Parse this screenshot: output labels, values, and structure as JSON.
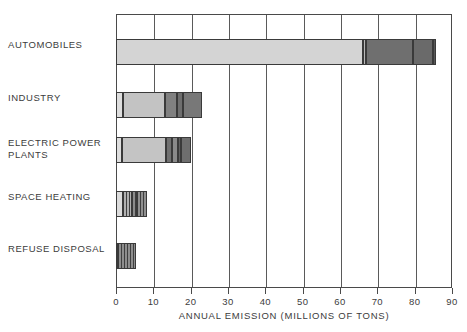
{
  "chart_data": {
    "type": "bar",
    "orientation": "horizontal",
    "stacked": true,
    "title": "",
    "xlabel": "ANNUAL EMISSION (MILLIONS OF TONS)",
    "ylabel": "",
    "xlim": [
      0,
      90
    ],
    "xticks": [
      0,
      10,
      20,
      30,
      40,
      50,
      60,
      70,
      80,
      90
    ],
    "xtick_labels": [
      "0",
      "10",
      "20",
      "30",
      "40",
      "50",
      "60",
      "70",
      "80",
      "90"
    ],
    "grid": "vertical",
    "legend": "none",
    "categories": [
      "AUTOMOBILES",
      "INDUSTRY",
      "ELECTRIC POWER\nPLANTS",
      "SPACE HEATING",
      "REFUSE DISPOSAL"
    ],
    "totals": [
      85.5,
      23.0,
      20.0,
      8.2,
      5.3
    ],
    "bars": [
      {
        "category": "AUTOMOBILES",
        "total": 85.5,
        "segments": [
          {
            "start": 0.0,
            "end": 66.0,
            "value": 66.0,
            "fill": "#d4d4d4",
            "pattern": "solid"
          },
          {
            "start": 66.0,
            "end": 66.8,
            "value": 0.8,
            "fill": "#b8b8b8",
            "pattern": "solid"
          },
          {
            "start": 66.8,
            "end": 79.5,
            "value": 12.7,
            "fill": "#6f6f6f",
            "pattern": "solid"
          },
          {
            "start": 79.5,
            "end": 84.8,
            "value": 5.3,
            "fill": "#6a6a6a",
            "pattern": "solid"
          },
          {
            "start": 84.8,
            "end": 85.5,
            "value": 0.7,
            "fill": "#585858",
            "pattern": "solid"
          }
        ]
      },
      {
        "category": "INDUSTRY",
        "total": 23.0,
        "segments": [
          {
            "start": 0.0,
            "end": 1.9,
            "value": 1.9,
            "fill": "#dedede",
            "pattern": "solid"
          },
          {
            "start": 1.9,
            "end": 13.0,
            "value": 11.1,
            "fill": "#c3c3c3",
            "pattern": "solid"
          },
          {
            "start": 13.0,
            "end": 16.2,
            "value": 3.2,
            "fill": "#808080",
            "pattern": "solid"
          },
          {
            "start": 16.2,
            "end": 17.8,
            "value": 1.6,
            "fill": "#6e6e6e",
            "pattern": "solid"
          },
          {
            "start": 17.8,
            "end": 23.0,
            "value": 5.2,
            "fill": "#787878",
            "pattern": "solid"
          }
        ]
      },
      {
        "category": "ELECTRIC POWER PLANTS",
        "total": 20.0,
        "segments": [
          {
            "start": 0.0,
            "end": 1.4,
            "value": 1.4,
            "fill": "#dedede",
            "pattern": "solid"
          },
          {
            "start": 1.4,
            "end": 13.2,
            "value": 11.8,
            "fill": "#c4c4c4",
            "pattern": "solid"
          },
          {
            "start": 13.2,
            "end": 15.0,
            "value": 1.8,
            "fill": "#707070",
            "pattern": "solid"
          },
          {
            "start": 15.0,
            "end": 16.6,
            "value": 1.6,
            "fill": "#8a8a8a",
            "pattern": "solid"
          },
          {
            "start": 16.6,
            "end": 17.4,
            "value": 0.8,
            "fill": "#606060",
            "pattern": "solid"
          },
          {
            "start": 17.4,
            "end": 20.0,
            "value": 2.6,
            "fill": "#6e6e6e",
            "pattern": "solid"
          }
        ]
      },
      {
        "category": "SPACE HEATING",
        "total": 8.2,
        "segments": [
          {
            "start": 0.0,
            "end": 1.8,
            "value": 1.8,
            "fill": "#dcdcdc",
            "pattern": "solid"
          },
          {
            "start": 1.8,
            "end": 4.2,
            "value": 2.4,
            "fill": "#b0b0b0",
            "pattern": "vertical-hatch"
          },
          {
            "start": 4.2,
            "end": 5.4,
            "value": 1.2,
            "fill": "#8c8c8c",
            "pattern": "vertical-hatch"
          },
          {
            "start": 5.4,
            "end": 8.2,
            "value": 2.8,
            "fill": "#909090",
            "pattern": "vertical-hatch"
          }
        ]
      },
      {
        "category": "REFUSE DISPOSAL",
        "total": 5.3,
        "segments": [
          {
            "start": 0.0,
            "end": 0.5,
            "value": 0.5,
            "fill": "#d8d8d8",
            "pattern": "solid"
          },
          {
            "start": 0.5,
            "end": 5.3,
            "value": 4.8,
            "fill": "#8e8e8e",
            "pattern": "vertical-hatch"
          }
        ]
      }
    ],
    "colors": {
      "frame": "#4a4a4a",
      "gridline": "#5a5a5a",
      "text": "#3c3c3c",
      "bar_outline": "#3a3a3a",
      "light_fill": "#d4d4d4",
      "dark_fill": "#6f6f6f",
      "background": "#ffffff"
    }
  },
  "axis": {
    "x_title": "ANNUAL EMISSION (MILLIONS OF TONS)"
  }
}
